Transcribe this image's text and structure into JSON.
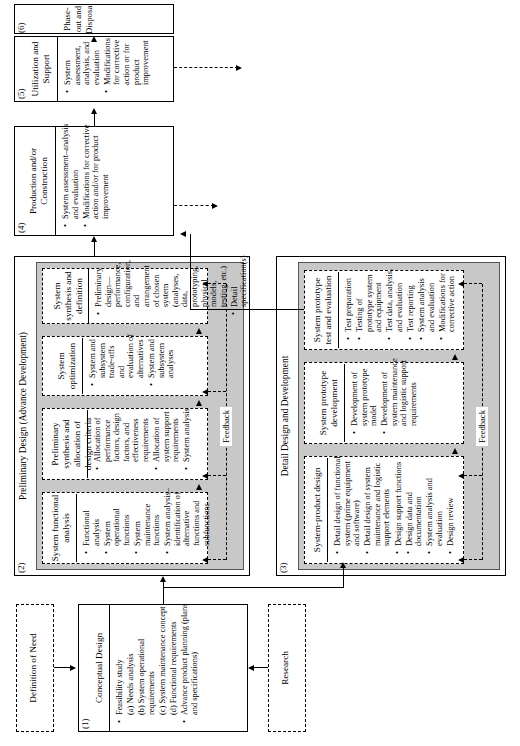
{
  "diagram": {
    "orientation": "rotated-90-ccw",
    "feedback_label": "Feedback"
  },
  "definition_of_need": {
    "label": "Definition of Need"
  },
  "research": {
    "label": "Research"
  },
  "phases": [
    {
      "number": "(1)",
      "header": "",
      "title": "Conceptual Design",
      "items": [
        "Feasibility study",
        "(a) Needs analysis",
        "(b) System operational requirements",
        "(c) System maintenance concept",
        "(d) Functional requirements",
        "Advance product planning (plans and specifications)"
      ],
      "bulleted": [
        true,
        false,
        false,
        false,
        false,
        true
      ]
    },
    {
      "number": "(2)",
      "header": "Preliminary Design (Advance Development)",
      "blocks": [
        {
          "title": "System functional analysis",
          "items": [
            "Functional analysis",
            "System operational functions",
            "System maintenance functions",
            "System analysis–identification of alternative functions and subfunctions"
          ]
        },
        {
          "title": "Preliminary synthesis and allocation of design criteria",
          "items": [
            "Allocation of performance factors, design factors, and effectiveness requirements",
            "Allocation of system support requirements",
            "System analysis"
          ]
        },
        {
          "title": "System optimization",
          "items": [
            "System and subsystem trade-offs and evaluation of alternatives",
            "System and subsystem analyses"
          ]
        },
        {
          "title": "System synthesis and definition",
          "items": [
            "Preliminary design—performance, configuration, and arrangement of chosen system (analyses, data, prototyping, physical models, testing, etc.)",
            "Detail specification(s)"
          ]
        }
      ]
    },
    {
      "number": "(3)",
      "header": "Detail Design and Development",
      "blocks": [
        {
          "title": "System-product design",
          "items": [
            "Detail design of functional system (prime equipment and software)",
            "Detail design of system maintenance and logistic support elements",
            "Design support functions",
            "Design data and documentation",
            "System analysis and evaluation",
            "Design review"
          ]
        },
        {
          "title": "System prototype development",
          "items": [
            "Development of system prototype model",
            "Development of system maintenance and logistic support requirements"
          ]
        },
        {
          "title": "System prototype test and evaluation",
          "items": [
            "Test preparation",
            "Testing of prototype system and equipment",
            "Test data, analysis, and evaluation",
            "Test reporting",
            "System analysis and evaluation",
            "Modifications for corrective action"
          ]
        }
      ]
    },
    {
      "number": "(4)",
      "title": "Production and/or Construction",
      "items": [
        "System assessment–analysis and evaluation",
        "Modifications for corrective action and/or for product improvement"
      ]
    },
    {
      "number": "(5)",
      "title": "Utilization and Support",
      "items": [
        "System assessment, analysis, and evaluation",
        "Modifications for corrective action or for product improvement"
      ]
    },
    {
      "number": "(6)",
      "title": "Phase-out and Disposal",
      "items": []
    }
  ],
  "colors": {
    "shade": "#c8c8c8",
    "line": "#000000",
    "background": "#ffffff"
  }
}
